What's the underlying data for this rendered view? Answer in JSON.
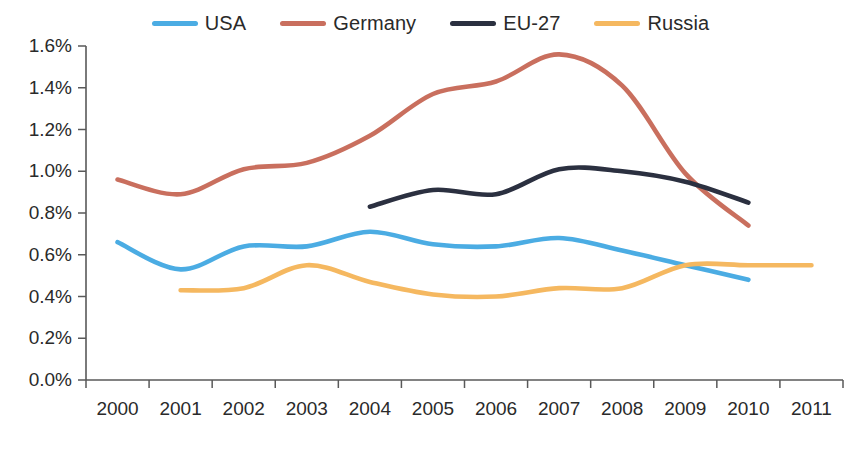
{
  "chart_data": {
    "type": "line",
    "title": "",
    "subtitle": "",
    "xlabel": "",
    "ylabel": "",
    "x": [
      2000,
      2001,
      2002,
      2003,
      2004,
      2005,
      2006,
      2007,
      2008,
      2009,
      2010,
      2011
    ],
    "xtick_labels": [
      "2000",
      "2001",
      "2002",
      "2003",
      "2004",
      "2005",
      "2006",
      "2007",
      "2008",
      "2009",
      "2010",
      "2011"
    ],
    "ytick_labels": [
      "0.0%",
      "0.2%",
      "0.4%",
      "0.6%",
      "0.8%",
      "1.0%",
      "1.2%",
      "1.4%",
      "1.6%"
    ],
    "ytick_values": [
      0.0,
      0.2,
      0.4,
      0.6,
      0.8,
      1.0,
      1.2,
      1.4,
      1.6
    ],
    "ylim": [
      0.0,
      1.6
    ],
    "xlim": [
      2000,
      2011
    ],
    "y_unit": "%",
    "grid": false,
    "legend_position": "top-center",
    "series": [
      {
        "name": "USA",
        "color": "#4BACE3",
        "x": [
          2000,
          2001,
          2002,
          2003,
          2004,
          2005,
          2006,
          2007,
          2008,
          2009,
          2010
        ],
        "values": [
          0.66,
          0.53,
          0.64,
          0.64,
          0.71,
          0.65,
          0.64,
          0.68,
          0.62,
          0.55,
          0.48
        ]
      },
      {
        "name": "Germany",
        "color": "#C96F5E",
        "x": [
          2000,
          2001,
          2002,
          2003,
          2004,
          2005,
          2006,
          2007,
          2008,
          2009,
          2010
        ],
        "values": [
          0.96,
          0.89,
          1.01,
          1.04,
          1.17,
          1.37,
          1.43,
          1.56,
          1.41,
          0.99,
          0.74
        ]
      },
      {
        "name": "EU-27",
        "color": "#2B3040",
        "x": [
          2004,
          2005,
          2006,
          2007,
          2008,
          2009,
          2010
        ],
        "values": [
          0.83,
          0.91,
          0.89,
          1.01,
          1.0,
          0.95,
          0.85
        ]
      },
      {
        "name": "Russia",
        "color": "#F5B860",
        "x": [
          2001,
          2002,
          2003,
          2004,
          2005,
          2006,
          2007,
          2008,
          2009,
          2010,
          2011
        ],
        "values": [
          0.43,
          0.44,
          0.55,
          0.47,
          0.41,
          0.4,
          0.44,
          0.44,
          0.55,
          0.55,
          0.55
        ]
      }
    ]
  },
  "legend": {
    "items": [
      {
        "label": "USA",
        "color": "#4BACE3"
      },
      {
        "label": "Germany",
        "color": "#C96F5E"
      },
      {
        "label": "EU-27",
        "color": "#2B3040"
      },
      {
        "label": "Russia",
        "color": "#F5B860"
      }
    ]
  },
  "axes": {
    "y_axis_name": "y-axis",
    "x_axis_name": "x-axis"
  }
}
